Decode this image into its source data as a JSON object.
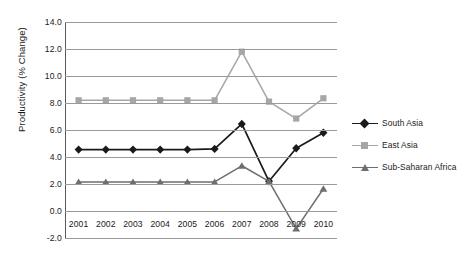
{
  "chart_data": {
    "type": "line",
    "title": "",
    "xlabel": "",
    "ylabel": "Productivity (% Change)",
    "categories": [
      "2001",
      "2002",
      "2003",
      "2004",
      "2005",
      "2006",
      "2007",
      "2008",
      "2009",
      "2010"
    ],
    "ylim": [
      -2.0,
      14.0
    ],
    "ytick_labels": [
      "14.0",
      "12.0",
      "10.0",
      "8.0",
      "6.0",
      "4.0",
      "2.0",
      "0.0",
      "-2.0"
    ],
    "ytick_values": [
      14.0,
      12.0,
      10.0,
      8.0,
      6.0,
      4.0,
      2.0,
      0.0,
      -2.0
    ],
    "grid": "horizontal",
    "legend_position": "right",
    "series": [
      {
        "name": "South Asia",
        "color": "#1a1a1a",
        "marker": "diamond",
        "values": [
          4.55,
          4.55,
          4.55,
          4.55,
          4.55,
          4.6,
          6.45,
          2.2,
          4.65,
          5.8
        ]
      },
      {
        "name": "East Asia",
        "color": "#a6a6a6",
        "marker": "square",
        "values": [
          8.2,
          8.2,
          8.2,
          8.2,
          8.2,
          8.2,
          11.8,
          8.1,
          6.85,
          8.35
        ]
      },
      {
        "name": "Sub-Saharan Africa",
        "color": "#6e6e6e",
        "marker": "triangle",
        "values": [
          2.15,
          2.15,
          2.15,
          2.15,
          2.15,
          2.15,
          3.35,
          2.2,
          -1.3,
          1.65
        ]
      }
    ]
  }
}
